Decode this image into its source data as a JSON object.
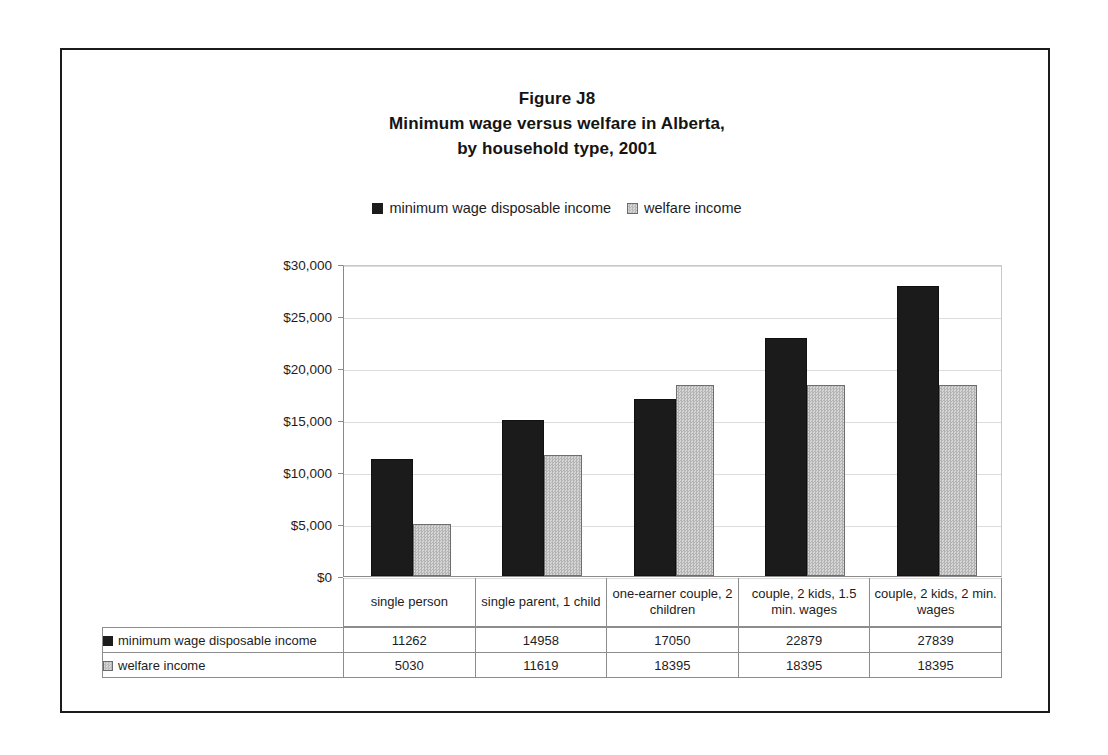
{
  "figure": {
    "title_lines": [
      "Figure J8",
      "Minimum wage versus welfare in Alberta,",
      "by household type, 2001"
    ]
  },
  "legend": {
    "entries": [
      {
        "label": "minimum wage disposable income",
        "swatch": "dark-square-icon",
        "color": "#1c1c1c"
      },
      {
        "label": "welfare income",
        "swatch": "light-square-icon",
        "color": "#cccccc"
      }
    ]
  },
  "chart_data": {
    "type": "bar",
    "title": "Figure J8 Minimum wage versus welfare in Alberta, by household type, 2001",
    "xlabel": "",
    "ylabel": "",
    "ylim": [
      0,
      30000
    ],
    "ytick_values": [
      0,
      5000,
      10000,
      15000,
      20000,
      25000,
      30000
    ],
    "ytick_labels": [
      "$0",
      "$5,000",
      "$10,000",
      "$15,000",
      "$20,000",
      "$25,000",
      "$30,000"
    ],
    "grid": true,
    "legend_position": "top-center",
    "categories": [
      "single person",
      "single parent, 1 child",
      "one-earner couple, 2 children",
      "couple, 2 kids, 1.5 min. wages",
      "couple, 2 kids, 2 min. wages"
    ],
    "series": [
      {
        "name": "minimum wage disposable income",
        "color": "#1b1b1b",
        "values": [
          11262,
          14958,
          17050,
          22879,
          27839
        ]
      },
      {
        "name": "welfare income",
        "color": "#cccccc",
        "values": [
          5030,
          11619,
          18395,
          18395,
          18395
        ]
      }
    ]
  },
  "table": {
    "rows": [
      {
        "swatch": "dark-square-icon",
        "label": "minimum wage disposable income",
        "values": [
          "11262",
          "14958",
          "17050",
          "22879",
          "27839"
        ]
      },
      {
        "swatch": "light-square-icon",
        "label": "welfare income",
        "values": [
          "5030",
          "11619",
          "18395",
          "18395",
          "18395"
        ]
      }
    ]
  }
}
